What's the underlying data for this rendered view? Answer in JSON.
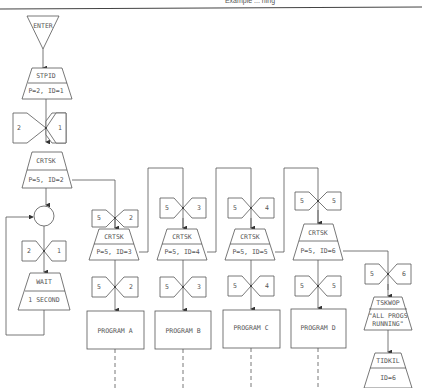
{
  "header": {
    "caption_fragment": "Example ... ning"
  },
  "diagram": {
    "colors": {
      "stroke": "#555555",
      "text": "#555555",
      "background": "#ffffff"
    },
    "enter": {
      "label": "ENTER"
    },
    "stpid": {
      "title": "STPID",
      "params": "P=2, ID=1"
    },
    "sync_main_1": {
      "left": "2",
      "right": "1"
    },
    "crtsk_main": {
      "title": "CRTSK",
      "params": "P=5, ID=2"
    },
    "junction": {
      "label": ""
    },
    "sync_main_2": {
      "left": "2",
      "right": "1"
    },
    "wait": {
      "title": "WAIT",
      "params": "1 SECOND"
    },
    "branches": [
      {
        "sync_top": {
          "left": "5",
          "right": "2"
        },
        "crtsk": {
          "title": "CRTSK",
          "params": "P=5, ID=3"
        },
        "sync_bottom": {
          "left": "5",
          "right": "2"
        },
        "program": "PROGRAM A"
      },
      {
        "sync_top": {
          "left": "5",
          "right": "3"
        },
        "crtsk": {
          "title": "CRTSK",
          "params": "P=5, ID=4"
        },
        "sync_bottom": {
          "left": "5",
          "right": "3"
        },
        "program": "PROGRAM B"
      },
      {
        "sync_top": {
          "left": "5",
          "right": "4"
        },
        "crtsk": {
          "title": "CRTSK",
          "params": "P=5, ID=5"
        },
        "sync_bottom": {
          "left": "5",
          "right": "4"
        },
        "program": "PROGRAM C"
      },
      {
        "sync_top": {
          "left": "5",
          "right": "5"
        },
        "crtsk": {
          "title": "CRTSK",
          "params": "P=5, ID=6"
        },
        "sync_bottom": {
          "left": "5",
          "right": "5"
        },
        "program": "PROGRAM D"
      }
    ],
    "final_branch": {
      "sync": {
        "left": "5",
        "right": "6"
      },
      "tskwop": {
        "title": "TSKWOP",
        "line1": "\"ALL PROGS",
        "line2": "RUNNING\""
      },
      "tdkil": {
        "title": "TIDKIL",
        "params": "ID=6"
      }
    }
  }
}
